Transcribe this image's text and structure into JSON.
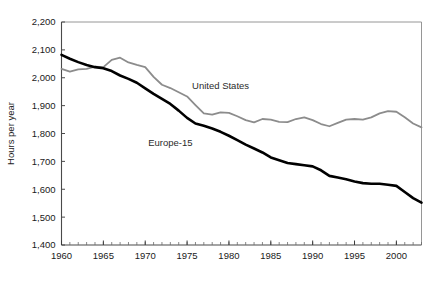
{
  "chart_data": {
    "type": "line",
    "title": "",
    "xlabel": "",
    "ylabel": "Hours per year",
    "xlim": [
      1960,
      2003
    ],
    "ylim": [
      1400,
      2200
    ],
    "ytick_step": 100,
    "xtick_step": 5,
    "xminor_step": 1,
    "grid": false,
    "legend_position": "inline-annotations",
    "ytick_labels": [
      "1,400",
      "1,500",
      "1,600",
      "1,700",
      "1,800",
      "1,900",
      "2,000",
      "2,100",
      "2,200"
    ],
    "ytick_values": [
      1400,
      1500,
      1600,
      1700,
      1800,
      1900,
      2000,
      2100,
      2200
    ],
    "xtick_labels": [
      "1960",
      "1965",
      "1970",
      "1975",
      "1980",
      "1985",
      "1990",
      "1995",
      "2000"
    ],
    "xtick_values": [
      1960,
      1965,
      1970,
      1975,
      1980,
      1985,
      1990,
      1995,
      2000
    ],
    "x": [
      1960,
      1961,
      1962,
      1963,
      1964,
      1965,
      1966,
      1967,
      1968,
      1969,
      1970,
      1971,
      1972,
      1973,
      1974,
      1975,
      1976,
      1977,
      1978,
      1979,
      1980,
      1981,
      1982,
      1983,
      1984,
      1985,
      1986,
      1987,
      1988,
      1989,
      1990,
      1991,
      1992,
      1993,
      1994,
      1995,
      1996,
      1997,
      1998,
      1999,
      2000,
      2001,
      2002,
      2003
    ],
    "series": [
      {
        "name": "United States",
        "color": "#8c8c8c",
        "label_x": 1979,
        "label_y": 1960,
        "values": [
          2032,
          2022,
          2030,
          2032,
          2040,
          2038,
          2064,
          2072,
          2055,
          2046,
          2038,
          2003,
          1975,
          1963,
          1948,
          1933,
          1902,
          1872,
          1868,
          1876,
          1874,
          1862,
          1848,
          1840,
          1852,
          1850,
          1842,
          1841,
          1852,
          1858,
          1848,
          1834,
          1826,
          1838,
          1850,
          1852,
          1850,
          1858,
          1872,
          1880,
          1878,
          1858,
          1836,
          1822
        ]
      },
      {
        "name": "Europe-15",
        "color": "#000000",
        "label_x": 1973,
        "label_y": 1756,
        "values": [
          2082,
          2068,
          2056,
          2046,
          2038,
          2034,
          2024,
          2008,
          1996,
          1982,
          1962,
          1942,
          1924,
          1906,
          1882,
          1856,
          1836,
          1828,
          1818,
          1806,
          1792,
          1776,
          1760,
          1746,
          1732,
          1714,
          1704,
          1694,
          1690,
          1686,
          1682,
          1668,
          1648,
          1642,
          1636,
          1628,
          1622,
          1620,
          1620,
          1616,
          1612,
          1590,
          1568,
          1552
        ]
      }
    ],
    "annotations": [
      {
        "text": "United States",
        "series": "United States"
      },
      {
        "text": "Europe-15",
        "series": "Europe-15"
      }
    ]
  },
  "axes": {
    "y_axis_title": "Hours per year"
  }
}
